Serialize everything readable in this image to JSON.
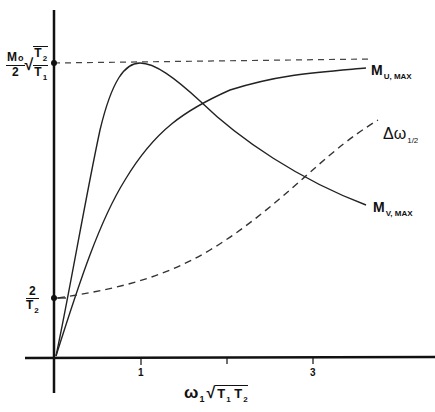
{
  "diagram": {
    "y_labels": {
      "top": {
        "numerator": "M",
        "numerator_sub": "o",
        "denominator": "2",
        "sqrt_num": "T",
        "sqrt_num_sub": "2",
        "sqrt_den": "T",
        "sqrt_den_sub": "1"
      },
      "bottom": {
        "numerator": "2",
        "denominator": "T",
        "denominator_sub": "2"
      }
    },
    "x_axis": {
      "label_omega": "ω",
      "label_omega_sub": "1",
      "label_sqrt": "T",
      "label_sqrt_sub1": "1",
      "label_sqrt2": "T",
      "label_sqrt_sub2": "2",
      "ticks": [
        "1",
        "",
        "3"
      ]
    },
    "curves": [
      {
        "name": "M",
        "sub": "U, MAX",
        "style": "solid"
      },
      {
        "name": "M",
        "sub": "V, MAX",
        "style": "solid"
      },
      {
        "name": "Δω",
        "sub": "1/2",
        "style": "dashed"
      }
    ]
  }
}
